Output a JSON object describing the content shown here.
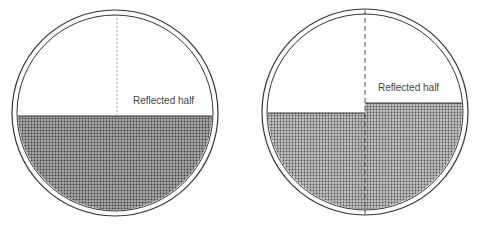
{
  "diagrams": [
    {
      "id": "left",
      "label": "Reflected half",
      "description": "Circle with level fill; dotted vertical divider in upper half"
    },
    {
      "id": "right",
      "label": "Reflected half",
      "description": "Circle with fill stepped higher on right half; dashed vertical divider"
    }
  ],
  "colors": {
    "outline": "#333333",
    "fill_dark": "#555555",
    "fill_mid": "#8a8a8a",
    "background": "#ffffff"
  }
}
